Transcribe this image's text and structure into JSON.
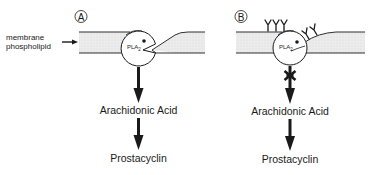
{
  "diagram": {
    "panels": [
      {
        "id": "A",
        "label": "A",
        "membrane_label": [
          "membrane",
          "phospholipid"
        ],
        "enzyme": "PLA",
        "enzyme_subscript": "2",
        "antibodies": 0,
        "blocked": false,
        "steps": [
          "Arachidonic Acid",
          "Prostacyclin"
        ]
      },
      {
        "id": "B",
        "label": "B",
        "enzyme": "PLA",
        "enzyme_subscript": "2",
        "antibodies": 5,
        "blocked": true,
        "steps": [
          "Arachidonic Acid",
          "Prostacyclin"
        ]
      }
    ],
    "colors": {
      "line": "#1a1a1a",
      "membrane_fill": "#e6e6e6",
      "background": "#ffffff"
    }
  }
}
